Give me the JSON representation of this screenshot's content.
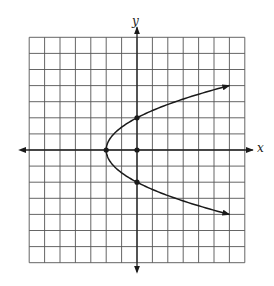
{
  "chart_data": {
    "type": "line",
    "title": "",
    "xlabel": "x",
    "ylabel": "y",
    "grid": true,
    "xlim": [
      -7,
      7
    ],
    "ylim": [
      -7,
      7
    ],
    "grid_cells": {
      "columns": 14,
      "rows": 14
    },
    "tick_labels": [],
    "curve": {
      "name": "parabola",
      "equation": "x = y^2/2 - 2",
      "opens": "right",
      "vertex": [
        -2,
        0
      ],
      "y_range": [
        -4,
        4
      ],
      "arrows_at_ends": true,
      "upper_end": [
        6,
        4
      ],
      "lower_end": [
        6,
        -4
      ]
    },
    "points": [
      {
        "label": "vertex",
        "x": -2,
        "y": 0
      },
      {
        "label": "y-intercept-top",
        "x": 0,
        "y": 2
      },
      {
        "label": "y-intercept-bottom",
        "x": 0,
        "y": -2
      },
      {
        "label": "origin",
        "x": 0,
        "y": 0
      }
    ]
  },
  "labels": {
    "x_axis": "x",
    "y_axis": "y"
  },
  "colors": {
    "grid": "#555555",
    "axis": "#222222",
    "curve": "#1a1a1a",
    "background": "#ffffff"
  },
  "layout": {
    "origin_px": [
      137,
      150
    ],
    "unit_px_x": 15.4,
    "unit_px_y": 16.1,
    "grid_left_px": 29,
    "grid_top_px": 37,
    "grid_right_px": 245,
    "grid_bottom_px": 263
  }
}
